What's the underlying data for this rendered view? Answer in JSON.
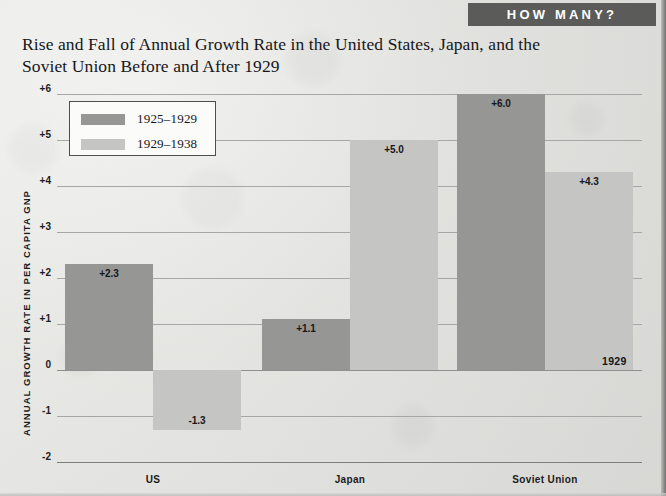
{
  "banner": {
    "label": "HOW MANY?"
  },
  "title": {
    "line1": "Rise and Fall of Annual Growth Rate in the United States, Japan, and the",
    "line2": "Soviet Union Before and After 1929"
  },
  "legend": {
    "items": [
      {
        "label": "1925–1929",
        "color": "#969694"
      },
      {
        "label": "1929–1938",
        "color": "#c5c5c3"
      }
    ]
  },
  "annotations": {
    "baseline_year": "1929"
  },
  "colors": {
    "series_dark": "#969694",
    "series_light": "#c5c5c3",
    "banner_bg": "#5b5b59",
    "gridline": "#a7a7a5",
    "text": "#17171a"
  },
  "chart_data": {
    "type": "bar",
    "title": "Rise and Fall of Annual Growth Rate in the United States, Japan, and the Soviet Union Before and After 1929",
    "xlabel": "",
    "ylabel": "ANNUAL GROWTH RATE IN PER CAPITA GNP",
    "categories": [
      "US",
      "Japan",
      "Soviet Union"
    ],
    "series": [
      {
        "name": "1925–1929",
        "values": [
          2.3,
          1.1,
          6.0
        ],
        "labels": [
          "+2.3",
          "+1.1",
          "+6.0"
        ],
        "color": "#969694"
      },
      {
        "name": "1929–1938",
        "values": [
          -1.3,
          5.0,
          4.3
        ],
        "labels": [
          "-1.3",
          "+5.0",
          "+4.3"
        ],
        "color": "#c5c5c3"
      }
    ],
    "ylim": [
      -2,
      6
    ],
    "yticks": [
      6,
      5,
      4,
      3,
      2,
      1,
      0,
      -1,
      -2
    ],
    "ytick_labels": [
      "+6",
      "+5",
      "+4",
      "+3",
      "+2",
      "+1",
      "0",
      "-1",
      "-2"
    ],
    "grid": true,
    "legend_position": "upper-left-inset",
    "annotation": "1929"
  }
}
